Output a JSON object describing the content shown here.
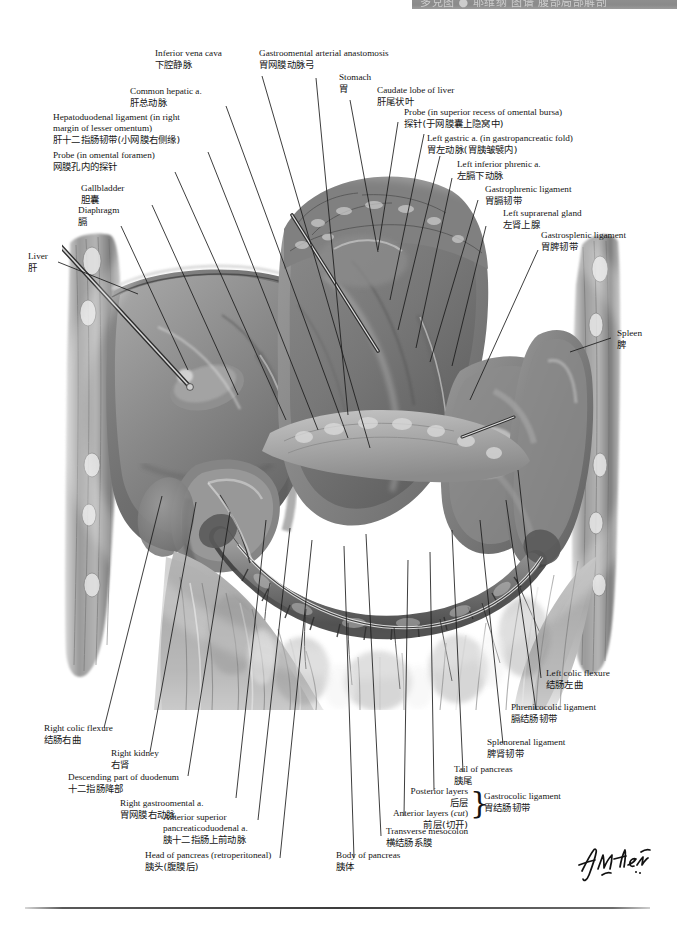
{
  "plate": {
    "title": "Omental bursa / Stomach reflected: peritoneal relationships",
    "banner_text": "多克图 ● 耶维纲 图谱 腹部局部解剖",
    "signature": "F. Netter"
  },
  "labels": {
    "inferior_vena_cava": {
      "en": "Inferior vena cava",
      "zh": "下腔静脉"
    },
    "common_hepatic_a": {
      "en": "Common hepatic a.",
      "zh": "肝总动脉"
    },
    "hepatoduodenal_lig": {
      "en_l1": "Hepatoduodenal ligament (in right",
      "en_l2": "margin of lesser omentum)",
      "zh": "肝十二指肠韧带(小网膜右侧缘)"
    },
    "probe_omental_foramen": {
      "en": "Probe (in omental foramen)",
      "zh": "网膜孔内的探针"
    },
    "gallbladder": {
      "en": "Gallbladder",
      "zh": "胆囊"
    },
    "diaphragm": {
      "en": "Diaphragm",
      "zh": "膈"
    },
    "liver": {
      "en": "Liver",
      "zh": "肝"
    },
    "gastroomental_anast": {
      "en": "Gastroomental arterial anastomosis",
      "zh": "胃网膜动脉弓"
    },
    "stomach": {
      "en": "Stomach",
      "zh": "胃"
    },
    "caudate_lobe": {
      "en": "Caudate lobe of liver",
      "zh": "肝尾状叶"
    },
    "probe_superior_recess": {
      "en": "Probe (in superior recess of omental bursa)",
      "zh": "探针(于网膜囊上隐窝中)"
    },
    "left_gastric_a": {
      "en": "Left gastric a. (in gastropancreatic fold)",
      "zh": "胃左动脉(胃胰皱襞内)"
    },
    "left_inf_phrenic_a": {
      "en": "Left inferior phrenic a.",
      "zh": "左膈下动脉"
    },
    "gastrophrenic_lig": {
      "en": "Gastrophrenic ligament",
      "zh": "胃膈韧带"
    },
    "left_suprarenal": {
      "en": "Left suprarenal gland",
      "zh": "左肾上腺"
    },
    "gastrosplenic_lig": {
      "en": "Gastrosplenic ligament",
      "zh": "胃脾韧带"
    },
    "spleen": {
      "en": "Spleen",
      "zh": "脾"
    },
    "left_colic_flexure": {
      "en": "Left colic flexure",
      "zh": "结肠左曲"
    },
    "phrenicocolic_lig": {
      "en": "Phrenicocolic ligament",
      "zh": "膈结肠韧带"
    },
    "splenorenal_lig": {
      "en": "Splenorenal ligament",
      "zh": "脾肾韧带"
    },
    "tail_of_pancreas": {
      "en": "Tail of pancreas",
      "zh": "胰尾"
    },
    "posterior_layers": {
      "en": "Posterior layers",
      "zh": "后层"
    },
    "anterior_layers": {
      "en": "Anterior layers (",
      "en_italic": "cut",
      "en_tail": ")",
      "zh": "前层(切开)"
    },
    "gastrocolic_lig": {
      "en": "Gastrocolic ligament",
      "zh": "胃结肠韧带"
    },
    "transverse_mesocolon": {
      "en": "Transverse mesocolon",
      "zh": "横结肠系膜"
    },
    "body_of_pancreas": {
      "en": "Body of pancreas",
      "zh": "胰体"
    },
    "head_of_pancreas": {
      "en": "Head of pancreas (retroperitoneal)",
      "zh": "胰头(腹膜后)"
    },
    "ant_sup_pd_a": {
      "en_l1": "Anterior superior",
      "en_l2": "pancreaticoduodenal a.",
      "zh": "胰十二指肠上前动脉"
    },
    "right_gastroomental_a": {
      "en": "Right gastroomental a.",
      "zh": "胃网膜右动脉"
    },
    "descending_duodenum": {
      "en": "Descending part of duodenum",
      "zh": "十二指肠降部"
    },
    "right_kidney": {
      "en": "Right kidney",
      "zh": "右肾"
    },
    "right_colic_flexure": {
      "en": "Right colic flexure",
      "zh": "结肠右曲"
    }
  },
  "colors": {
    "ink": "#141414",
    "leader": "#1b1b1b",
    "banner": "#8e8e8e",
    "rule": "#3d3d3d",
    "paper": "#ffffff"
  }
}
